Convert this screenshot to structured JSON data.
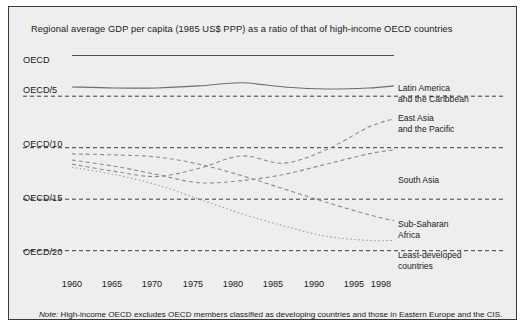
{
  "chart_data": {
    "type": "line",
    "title": "Regional average GDP per capita (1985 US$ PPP) as a ratio of that of high-income OECD countries",
    "xlabel": "",
    "ylabel": "",
    "grid": true,
    "legend_position": "right-inline",
    "x": [
      1960,
      1965,
      1970,
      1975,
      1980,
      1985,
      1990,
      1995,
      1998
    ],
    "xlim": [
      1960,
      1998
    ],
    "xtick_labels": [
      "1960",
      "1965",
      "1970",
      "1975",
      "1980",
      "1985",
      "1990",
      "1995",
      "1998"
    ],
    "ytick_labels": [
      "OECD",
      "OECD/5",
      "OECD/10",
      "OECD/15",
      "OECD/20"
    ],
    "ytick_values": [
      1,
      5,
      10,
      15,
      20
    ],
    "ylim_divisor": [
      1,
      21
    ],
    "note": "High-income OECD excludes OECD members classified as developing countries and those in Eastern Europe and the CIS.",
    "series": [
      {
        "name": "OECD",
        "style": "solid-reference",
        "color": "#1a1a1a",
        "values_divisor": [
          1,
          1,
          1,
          1,
          1,
          1,
          1,
          1,
          1
        ]
      },
      {
        "name": "Latin America and the Caribbean",
        "label_lines": [
          "Latin America",
          "and the Caribbean"
        ],
        "style": "solid",
        "color": "#6e6e6e",
        "values_divisor": [
          4.1,
          4.2,
          4.2,
          4.0,
          3.7,
          4.1,
          4.3,
          4.2,
          4.0
        ]
      },
      {
        "name": "East Asia and the Pacific",
        "label_lines": [
          "East Asia",
          "and the Pacific"
        ],
        "style": "dashed",
        "color": "#8a8a8a",
        "values_divisor": [
          11.6,
          12.3,
          12.8,
          12.0,
          10.8,
          11.5,
          10.2,
          8.0,
          7.2
        ]
      },
      {
        "name": "South Asia",
        "label_lines": [
          "South Asia"
        ],
        "style": "dashed",
        "color": "#8a8a8a",
        "values_divisor": [
          11.2,
          11.8,
          12.6,
          13.4,
          13.2,
          12.6,
          11.6,
          10.6,
          10.2
        ]
      },
      {
        "name": "Sub-Saharan Africa",
        "label_lines": [
          "Sub-Saharan",
          "Africa"
        ],
        "style": "dashed",
        "color": "#8a8a8a",
        "values_divisor": [
          10.6,
          10.7,
          10.9,
          11.6,
          12.7,
          14.0,
          15.3,
          16.5,
          17.1
        ]
      },
      {
        "name": "Least-developed countries",
        "label_lines": [
          "Least-developed",
          "countries"
        ],
        "style": "dotted",
        "color": "#9a9a9a",
        "values_divisor": [
          11.9,
          12.6,
          13.6,
          15.0,
          16.4,
          17.6,
          18.6,
          19.0,
          19.0
        ]
      }
    ]
  },
  "axis": {
    "y_labels": [
      {
        "text": "OECD",
        "top": 4
      },
      {
        "text": "OECD/5",
        "top": 34
      },
      {
        "text": "OECD/10",
        "top": 88
      },
      {
        "text": "OECD/15",
        "top": 142
      },
      {
        "text": "OECD/20",
        "top": 196
      }
    ],
    "x_labels": [
      "1960",
      "1965",
      "1970",
      "1975",
      "1980",
      "1985",
      "1990",
      "1995",
      "1998"
    ]
  },
  "labels": {
    "latin_america_l1": "Latin America",
    "latin_america_l2": "and the Caribbean",
    "east_asia_l1": "East Asia",
    "east_asia_l2": "and the Pacific",
    "south_asia_l1": "South Asia",
    "sub_saharan_l1": "Sub-Saharan",
    "sub_saharan_l2": "Africa",
    "least_developed_l1": "Least-developed",
    "least_developed_l2": "countries"
  },
  "note": {
    "prefix": "Note:",
    "text": "High-income OECD excludes OECD members classified as developing countries and those in Eastern Europe and the CIS."
  },
  "title": "Regional average GDP per capita (1985 US$ PPP) as a ratio of that of high-income OECD countries"
}
